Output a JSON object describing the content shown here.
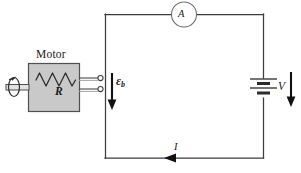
{
  "figure": {
    "type": "circuit-diagram",
    "background_color": "#ffffff",
    "wire_color": "#3a3a3a",
    "box_fill_color": "#c9c9c9",
    "box_stroke_color": "#4a4a4a",
    "arrow_color": "#111111"
  },
  "labels": {
    "motor": "Motor",
    "resistance": "R",
    "ammeter": "A",
    "back_emf_symbol": "ε",
    "back_emf_subscript": "b",
    "voltage": "V",
    "current": "I"
  },
  "components": {
    "motor_box": {
      "name": "Motor",
      "contains": "R",
      "has_shaft": true,
      "shaft_rotation_arrow": true
    },
    "ammeter": {
      "symbol": "A",
      "shape": "circle",
      "position": "top-branch"
    },
    "battery": {
      "symbol": "V",
      "plates": 4,
      "position": "right-branch"
    },
    "terminals": {
      "count": 2,
      "style": "open-circle"
    }
  },
  "annotations": [
    {
      "name": "back-emf-arrow",
      "label": "εb",
      "direction": "down"
    },
    {
      "name": "voltage-arrow",
      "label": "V",
      "direction": "down"
    },
    {
      "name": "current-arrow",
      "label": "I",
      "direction": "left"
    }
  ]
}
